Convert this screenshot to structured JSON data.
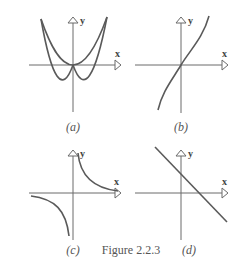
{
  "figure": {
    "caption": "Figure 2.2.3",
    "panels": [
      {
        "id": "a",
        "label": "(a)",
        "x_axis_label": "x",
        "y_axis_label": "y",
        "curve": "parabola opening upward with vertex at origin"
      },
      {
        "id": "b",
        "label": "(b)",
        "x_axis_label": "x",
        "y_axis_label": "y",
        "curve": "increasing cubic-like curve through origin"
      },
      {
        "id": "c",
        "label": "(c)",
        "x_axis_label": "x",
        "y_axis_label": "y",
        "curve": "hyperbola y = 1/x, two branches in quadrants I and III"
      },
      {
        "id": "d",
        "label": "(d)",
        "x_axis_label": "x",
        "y_axis_label": "y",
        "curve": "decreasing straight line with positive y-intercept and positive x-intercept"
      }
    ]
  },
  "colors": {
    "axis": "#6a6a6a",
    "curve": "#5a5a5a",
    "text": "#555555",
    "background": "#ffffff"
  }
}
